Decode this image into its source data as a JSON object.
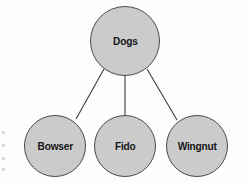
{
  "diagram": {
    "type": "tree",
    "colors": {
      "node_fill": "#cbcbcb",
      "node_stroke": "#4a4a4a",
      "edge_stroke": "#3c3c3c",
      "label_text": "#151515",
      "background": "#fdfdfd"
    },
    "root": {
      "id": "dogs",
      "label": "Dogs",
      "cx": 125,
      "cy": 41,
      "r": 35
    },
    "children": [
      {
        "id": "bowser",
        "label": "Bowser",
        "cx": 55,
        "cy": 146,
        "r": 31
      },
      {
        "id": "fido",
        "label": "Fido",
        "cx": 125,
        "cy": 146,
        "r": 31
      },
      {
        "id": "wingnut",
        "label": "Wingnut",
        "cx": 197,
        "cy": 146,
        "r": 31
      }
    ],
    "edges": [
      {
        "id": "edge-dogs-bowser",
        "from": "dogs",
        "to": "bowser",
        "x1": 104,
        "y1": 69,
        "x2": 76,
        "y2": 119
      },
      {
        "id": "edge-dogs-fido",
        "from": "dogs",
        "to": "fido",
        "x1": 125,
        "y1": 76,
        "x2": 125,
        "y2": 115
      },
      {
        "id": "edge-dogs-wingnut",
        "from": "dogs",
        "to": "wingnut",
        "x1": 147,
        "y1": 69,
        "x2": 177,
        "y2": 120
      }
    ]
  }
}
